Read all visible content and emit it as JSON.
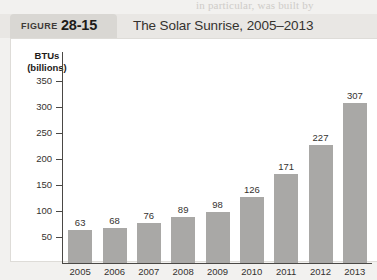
{
  "page": {
    "cut_off_text": "in particular, was built by",
    "figure_word": "FIGURE",
    "figure_number": "28-15",
    "figure_title": "The Solar Sunrise, 2005–2013"
  },
  "colors": {
    "bar_fill": "#a9a8a6",
    "axis": "#4a4845",
    "panel_bg": "#ffffff",
    "header_band": "#e9e7e4",
    "tab_bg": "#d9d7d3",
    "page_bg": "#f2f1ef",
    "text": "#35322f"
  },
  "chart_data": {
    "type": "bar",
    "title": "The Solar Sunrise, 2005–2013",
    "xlabel": "",
    "ylabel": "BTUs (billions)",
    "ylabel_line1": "BTUs",
    "ylabel_line2": "(billions)",
    "categories": [
      "2005",
      "2006",
      "2007",
      "2008",
      "2009",
      "2010",
      "2011",
      "2012",
      "2013"
    ],
    "values": [
      63,
      68,
      76,
      89,
      98,
      126,
      171,
      227,
      307
    ],
    "value_labels": [
      "63",
      "68",
      "76",
      "89",
      "98",
      "126",
      "171",
      "227",
      "307"
    ],
    "yticks": [
      50,
      100,
      150,
      200,
      250,
      300,
      350
    ],
    "ytick_labels": [
      "50",
      "100",
      "150",
      "200",
      "250",
      "300",
      "350"
    ],
    "ylim": [
      0,
      350
    ],
    "grid": false,
    "legend": null
  }
}
